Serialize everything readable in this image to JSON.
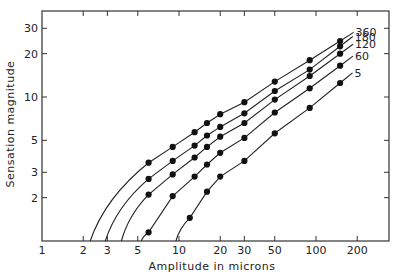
{
  "chart_data": {
    "type": "line",
    "title": "",
    "xlabel": "Amplitude in microns",
    "ylabel": "Sensation magnitude",
    "xscale": "log",
    "yscale": "log",
    "xlim": [
      1,
      300
    ],
    "ylim": [
      1,
      40
    ],
    "x_ticks": [
      1,
      2,
      3,
      5,
      10,
      20,
      30,
      50,
      100,
      200
    ],
    "x_tick_labels": [
      "1",
      "2",
      "3",
      "5",
      "10",
      "20",
      "30",
      "50",
      "100",
      "200"
    ],
    "y_ticks": [
      2,
      3,
      5,
      10,
      20,
      30
    ],
    "y_tick_labels": [
      "2",
      "3",
      "5",
      "10",
      "20",
      "30"
    ],
    "grid": false,
    "legend": "inline labels at right end of curves",
    "series": [
      {
        "name": "360",
        "x_intercept": 2.25,
        "points": [
          [
            6,
            3.5
          ],
          [
            9,
            4.5
          ],
          [
            13,
            5.7
          ],
          [
            16,
            6.6
          ],
          [
            20,
            7.6
          ],
          [
            30,
            9.2
          ],
          [
            50,
            12.8
          ],
          [
            90,
            18
          ],
          [
            150,
            24.5
          ]
        ]
      },
      {
        "name": "180",
        "x_intercept": 2.9,
        "points": [
          [
            6,
            2.7
          ],
          [
            9,
            3.6
          ],
          [
            13,
            4.6
          ],
          [
            16,
            5.4
          ],
          [
            20,
            6.2
          ],
          [
            30,
            7.7
          ],
          [
            50,
            11
          ],
          [
            90,
            15.5
          ],
          [
            150,
            22.5
          ]
        ]
      },
      {
        "name": "120",
        "x_intercept": 3.8,
        "points": [
          [
            6,
            2.1
          ],
          [
            9,
            2.9
          ],
          [
            13,
            3.8
          ],
          [
            16,
            4.5
          ],
          [
            20,
            5.3
          ],
          [
            30,
            6.6
          ],
          [
            50,
            9.6
          ],
          [
            90,
            14
          ],
          [
            150,
            20
          ]
        ]
      },
      {
        "name": "60",
        "x_intercept": 5.3,
        "points": [
          [
            6,
            1.15
          ],
          [
            9,
            2.05
          ],
          [
            13,
            2.8
          ],
          [
            16,
            3.4
          ],
          [
            20,
            4.1
          ],
          [
            30,
            5.2
          ],
          [
            50,
            7.8
          ],
          [
            90,
            11.5
          ],
          [
            150,
            16.5
          ]
        ]
      },
      {
        "name": "5",
        "x_intercept": 9.5,
        "points": [
          [
            12,
            1.45
          ],
          [
            16,
            2.2
          ],
          [
            20,
            2.8
          ],
          [
            30,
            3.6
          ],
          [
            50,
            5.6
          ],
          [
            90,
            8.4
          ],
          [
            150,
            12.5
          ]
        ]
      }
    ]
  }
}
